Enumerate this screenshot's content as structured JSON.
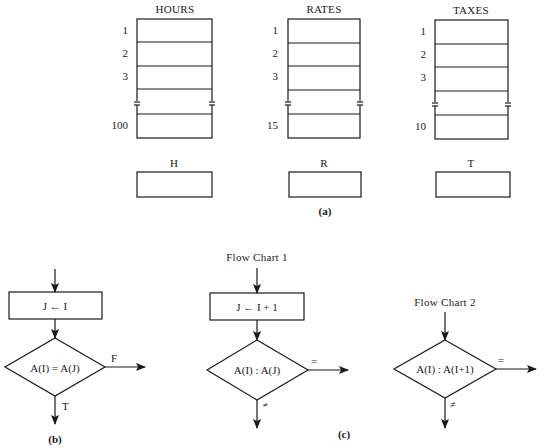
{
  "figure_a": {
    "caption": "(a)",
    "arrays": [
      {
        "name": "HOURS",
        "indices": [
          "1",
          "2",
          "3",
          "100"
        ]
      },
      {
        "name": "RATES",
        "indices": [
          "1",
          "2",
          "3",
          "15"
        ]
      },
      {
        "name": "TAXES",
        "indices": [
          "1",
          "2",
          "3",
          "10"
        ]
      }
    ],
    "scalars": [
      {
        "name": "H"
      },
      {
        "name": "R"
      },
      {
        "name": "T"
      }
    ]
  },
  "figure_b": {
    "caption": "(b)",
    "process_box": "J ← I",
    "decision": "A(I) = A(J)",
    "right_branch": "F",
    "down_branch": "T"
  },
  "figure_c": {
    "caption": "(c)",
    "flow_chart_1": {
      "title": "Flow Chart 1",
      "process_box": "J ← I + 1",
      "decision": "A(I) : A(J)",
      "right_branch": "=",
      "down_branch": "≠"
    },
    "flow_chart_2": {
      "title": "Flow Chart 2",
      "decision": "A(I) : A(I+1)",
      "right_branch": "=",
      "down_branch": "≠"
    }
  }
}
